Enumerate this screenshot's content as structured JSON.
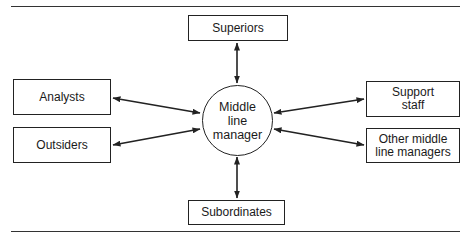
{
  "diagram": {
    "center": {
      "label": "Middle\nline\nmanager"
    },
    "nodes": [
      {
        "id": "superiors",
        "label": "Superiors"
      },
      {
        "id": "analysts",
        "label": "Analysts"
      },
      {
        "id": "outsiders",
        "label": "Outsiders"
      },
      {
        "id": "support_staff",
        "label": "Support\nstaff"
      },
      {
        "id": "other_middle_line_managers",
        "label": "Other middle\nline managers"
      },
      {
        "id": "subordinates",
        "label": "Subordinates"
      }
    ],
    "edges": [
      {
        "from": "middle_line_manager",
        "to": "superiors",
        "direction": "both"
      },
      {
        "from": "middle_line_manager",
        "to": "analysts",
        "direction": "both"
      },
      {
        "from": "middle_line_manager",
        "to": "outsiders",
        "direction": "both"
      },
      {
        "from": "middle_line_manager",
        "to": "support_staff",
        "direction": "both"
      },
      {
        "from": "middle_line_manager",
        "to": "other_middle_line_managers",
        "direction": "both"
      },
      {
        "from": "middle_line_manager",
        "to": "subordinates",
        "direction": "both"
      }
    ],
    "colors": {
      "line": "#222222",
      "background": "#ffffff"
    }
  }
}
